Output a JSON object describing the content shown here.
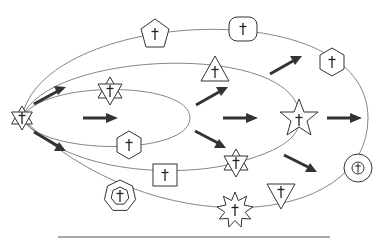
{
  "diagram": {
    "title": "",
    "colors": {
      "stroke": "#333333",
      "orbit": "#777777",
      "background": "#ffffff"
    },
    "origin": {
      "shape": "hexagram",
      "icon": "cross",
      "x": 22,
      "y": 118
    },
    "orbits": [
      {
        "id": "orbit-1",
        "rx_right": 190
      },
      {
        "id": "orbit-2",
        "rx_right": 300
      },
      {
        "id": "orbit-3",
        "rx_right": 368
      },
      {
        "id": "orbit-4",
        "rx_right": 300
      }
    ],
    "nodes": [
      {
        "id": "pentagon",
        "shape": "pentagon",
        "icon": "cross",
        "x": 155,
        "y": 34
      },
      {
        "id": "rounded-square",
        "shape": "rounded-square",
        "icon": "cross",
        "x": 243,
        "y": 29
      },
      {
        "id": "hexagram-top",
        "shape": "hexagram",
        "icon": "cross",
        "x": 110,
        "y": 91
      },
      {
        "id": "triangle-up",
        "shape": "triangle",
        "icon": "cross",
        "x": 215,
        "y": 71
      },
      {
        "id": "hexagon-right",
        "shape": "hexagon",
        "icon": "cross",
        "x": 332,
        "y": 62
      },
      {
        "id": "star-5",
        "shape": "star",
        "icon": "cross",
        "x": 299,
        "y": 118
      },
      {
        "id": "hexagon-inner",
        "shape": "hexagon",
        "icon": "cross",
        "x": 129,
        "y": 145
      },
      {
        "id": "square",
        "shape": "square",
        "icon": "cross",
        "x": 165,
        "y": 175
      },
      {
        "id": "hexagram-bottom",
        "shape": "hexagram",
        "icon": "cross",
        "x": 236,
        "y": 163
      },
      {
        "id": "circle",
        "shape": "double-circle",
        "icon": "cross",
        "x": 358,
        "y": 168
      },
      {
        "id": "heptagon",
        "shape": "double-heptagon",
        "icon": "cross",
        "x": 120,
        "y": 196
      },
      {
        "id": "starburst",
        "shape": "starburst",
        "icon": "cross",
        "x": 235,
        "y": 210
      },
      {
        "id": "triangle-down",
        "shape": "inverted-triangle",
        "icon": "cross",
        "x": 281,
        "y": 194
      }
    ],
    "arrows": [
      {
        "from": [
          34,
          103
        ],
        "to": [
          64,
          88
        ]
      },
      {
        "from": [
          34,
          133
        ],
        "to": [
          64,
          150
        ]
      },
      {
        "from": [
          83,
          118
        ],
        "to": [
          117,
          118
        ]
      },
      {
        "from": [
          197,
          104
        ],
        "to": [
          226,
          88
        ]
      },
      {
        "from": [
          196,
          132
        ],
        "to": [
          224,
          147
        ]
      },
      {
        "from": [
          223,
          118
        ],
        "to": [
          257,
          118
        ]
      },
      {
        "from": [
          270,
          74
        ],
        "to": [
          301,
          57
        ]
      },
      {
        "from": [
          327,
          118
        ],
        "to": [
          360,
          118
        ]
      },
      {
        "from": [
          285,
          155
        ],
        "to": [
          315,
          171
        ]
      }
    ],
    "caption": ""
  }
}
